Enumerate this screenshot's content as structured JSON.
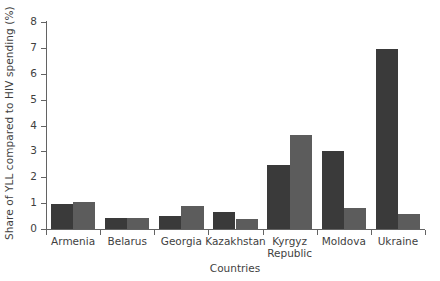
{
  "chart_data": {
    "type": "bar",
    "title": "",
    "xlabel": "Countries",
    "ylabel": "Share of YLL compared to HIV spending (%)",
    "ylim": [
      0,
      8
    ],
    "yticks": [
      "0",
      "1",
      "2",
      "3",
      "4",
      "5",
      "6",
      "7",
      "8"
    ],
    "grid": false,
    "legend": "none",
    "categories": [
      "Armenia",
      "Belarus",
      "Georgia",
      "Kazakhstan",
      "Kyrgyz\nRepublic",
      "Moldova",
      "Ukraine"
    ],
    "series": [
      {
        "name": "series-1",
        "color": "#3a3a3a",
        "values": [
          0.97,
          0.42,
          0.52,
          0.66,
          2.49,
          3.0,
          6.95
        ]
      },
      {
        "name": "series-2",
        "color": "#5c5c5c",
        "values": [
          1.05,
          0.42,
          0.9,
          0.4,
          3.63,
          0.83,
          0.57
        ]
      }
    ]
  },
  "colors": {
    "axis": "#636363",
    "text": "#3f3f3f",
    "background": "#ffffff"
  }
}
